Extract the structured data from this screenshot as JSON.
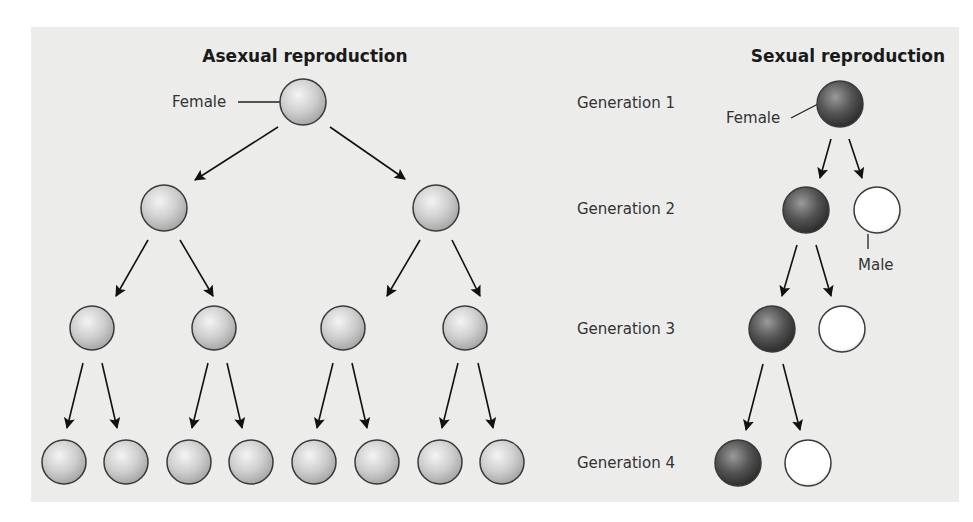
{
  "asexual": {
    "title": "Asexual reproduction",
    "female_label": "Female"
  },
  "sexual": {
    "title": "Sexual reproduction",
    "female_label": "Female",
    "male_label": "Male",
    "generations": [
      "Generation 1",
      "Generation 2",
      "Generation 3",
      "Generation 4"
    ]
  },
  "colors": {
    "background": "#ececeb",
    "asexual_individual": "#c8c8c8",
    "female_individual": "#555555",
    "male_individual": "#ffffff",
    "arrow": "#111111"
  }
}
